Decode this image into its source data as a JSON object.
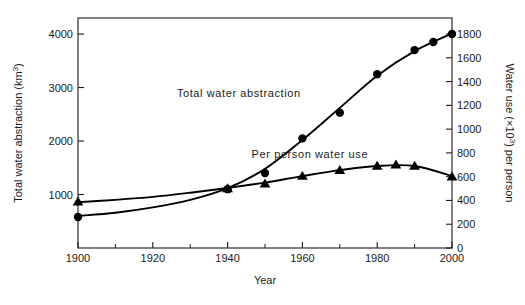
{
  "figure": {
    "background_color": "#ffffff",
    "foreground_color": "#1a1a1a",
    "title": ""
  },
  "axes": {
    "x": {
      "label": "Year",
      "min": 1900,
      "max": 2000,
      "major_ticks": [
        1900,
        1920,
        1940,
        1960,
        1980,
        2000
      ],
      "major_tick_labels": [
        "1900",
        "1920",
        "1940",
        "1960",
        "1980",
        "2000"
      ],
      "minor_ticks": [
        1910,
        1930,
        1950,
        1970,
        1990
      ]
    },
    "y_left": {
      "label": "Total water abstraction (km3)",
      "label_main": "Total water abstraction (km",
      "label_super": "3",
      "label_close": ")",
      "min": 0,
      "max": 4300,
      "major_ticks": [
        1000,
        2000,
        3000,
        4000
      ],
      "major_tick_labels": [
        "1000",
        "2000",
        "3000",
        "4000"
      ]
    },
    "y_right": {
      "label": "Water use (x103) per person",
      "label_part1": "Water use (×10",
      "label_super": "3",
      "label_part2": ") per person",
      "min": 0,
      "max": 1935,
      "major_ticks": [
        0,
        200,
        400,
        600,
        800,
        1000,
        1200,
        1400,
        1600,
        1800
      ],
      "major_tick_labels": [
        "0",
        "200",
        "400",
        "600",
        "800",
        "1000",
        "1200",
        "1400",
        "1600",
        "1800"
      ]
    }
  },
  "annotations": [
    {
      "name": "total-water-abstraction-label",
      "text": "Total water abstraction",
      "x": 1943,
      "y": 2820
    },
    {
      "name": "per-person-water-use-label",
      "text": "Per person water use",
      "x": 1962,
      "y": 760
    }
  ],
  "chart_data": {
    "type": "line",
    "title": "",
    "xlabel": "Year",
    "ylabel": "Total water abstraction (km3)",
    "ylabel_right": "Water use (x103) per person",
    "xlim": [
      1900,
      2000
    ],
    "ylim": [
      0,
      4300
    ],
    "ylim_right": [
      0,
      1935
    ],
    "grid": false,
    "legend": "inline annotations",
    "series": [
      {
        "name": "Total water abstraction",
        "axis": "left",
        "units": "km3",
        "marker": "circle",
        "x": [
          1900,
          1940,
          1950,
          1960,
          1970,
          1980,
          1990,
          1995,
          2000
        ],
        "values": [
          580,
          1100,
          1400,
          2050,
          2530,
          3250,
          3700,
          3850,
          4000
        ],
        "curve_x": [
          1900,
          1910,
          1920,
          1930,
          1940,
          1950,
          1960,
          1970,
          1980,
          1990,
          2000
        ],
        "curve_values": [
          600,
          660,
          760,
          900,
          1120,
          1480,
          2020,
          2620,
          3220,
          3680,
          4010
        ]
      },
      {
        "name": "Per person water use",
        "axis": "right",
        "units": "x103 per person",
        "marker": "triangle",
        "x": [
          1900,
          1940,
          1950,
          1960,
          1970,
          1980,
          1985,
          1990,
          2000
        ],
        "values": [
          390,
          500,
          540,
          605,
          655,
          690,
          700,
          690,
          600
        ],
        "curve_x": [
          1900,
          1910,
          1920,
          1930,
          1940,
          1950,
          1960,
          1970,
          1980,
          1990,
          2000
        ],
        "curve_values": [
          385,
          405,
          430,
          465,
          505,
          550,
          605,
          655,
          690,
          690,
          605
        ]
      }
    ]
  }
}
